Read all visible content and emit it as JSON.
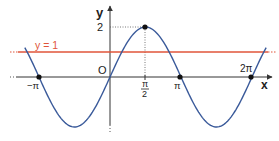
{
  "chart_data": {
    "type": "line",
    "title": "",
    "xlabel": "x",
    "ylabel": "y",
    "function": "y = 2 sin(x)",
    "xlim": [
      -3.77,
      6.91
    ],
    "ylim": [
      -2.0,
      2.0
    ],
    "grid": false,
    "series": [
      {
        "name": "y = 2sin(x)",
        "color": "#3a5a9a",
        "x": [
          -3.77,
          -3.14,
          -2.36,
          -1.57,
          -0.79,
          0,
          0.79,
          1.57,
          2.36,
          3.14,
          3.93,
          4.71,
          5.5,
          6.28,
          6.91
        ],
        "y": [
          1.18,
          0,
          -1.41,
          -2,
          -1.41,
          0,
          1.41,
          2,
          1.41,
          0,
          -1.41,
          -2,
          -1.41,
          0,
          1.18
        ]
      },
      {
        "name": "y = 1",
        "color": "#e0553a",
        "x": [
          -4.5,
          7.3
        ],
        "y": [
          1,
          1
        ]
      }
    ],
    "marked_points": [
      {
        "x": -3.14,
        "y": 0,
        "label": "−π"
      },
      {
        "x": 1.57,
        "y": 2,
        "label": "π/2, 2"
      },
      {
        "x": 3.14,
        "y": 0,
        "label": "π"
      },
      {
        "x": 6.28,
        "y": 0,
        "label": "2π"
      }
    ],
    "x_ticks": [
      "−π",
      "π/2",
      "π",
      "2π"
    ],
    "y_ticks": [
      "2"
    ],
    "annotations": [
      "y = 1",
      "O"
    ]
  },
  "labels": {
    "x_axis": "x",
    "y_axis": "y",
    "origin": "O",
    "y_tick_2": "2",
    "line_label": "y = 1",
    "tick_neg_pi": "−π",
    "tick_pi_half_num": "π",
    "tick_pi_half_den": "2",
    "tick_pi": "π",
    "tick_2pi": "2π"
  },
  "colors": {
    "curve": "#3a5a9a",
    "hline": "#e0553a",
    "axis": "#333333"
  }
}
